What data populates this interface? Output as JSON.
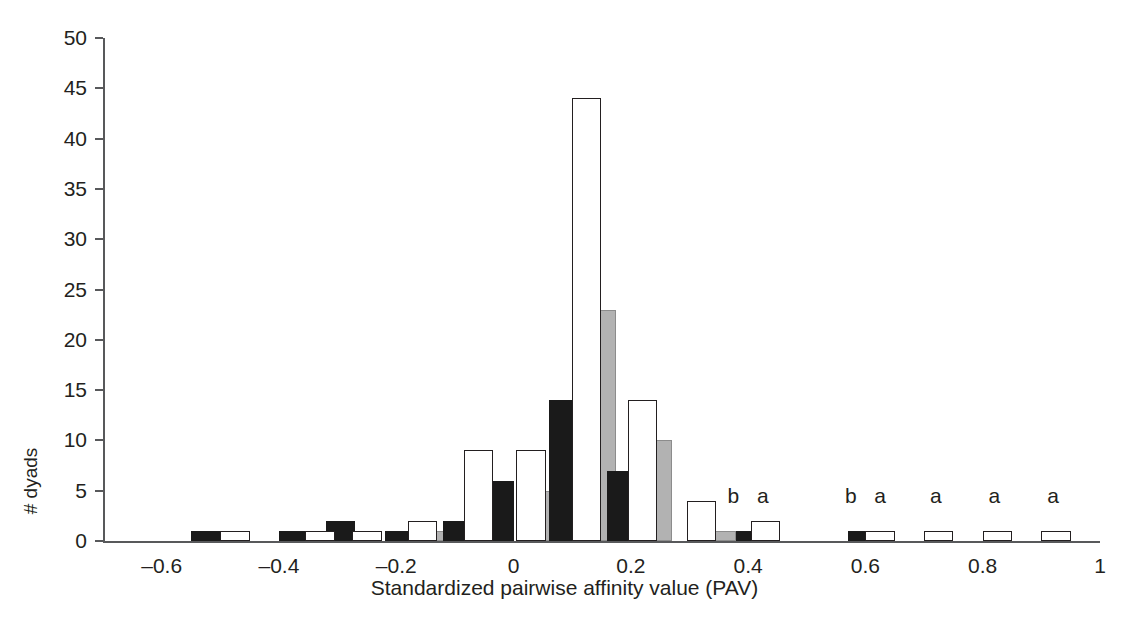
{
  "chart_data": {
    "type": "bar",
    "title": "",
    "subtitle": "",
    "xlabel": "Standardized pairwise affinity value (PAV)",
    "ylabel": "# dyads",
    "xlim": [
      -0.7,
      1.0
    ],
    "ylim": [
      0,
      50
    ],
    "grid": false,
    "legend": "none",
    "bin_width": 0.05,
    "x_ticks": [
      "–0.6",
      "–0.4",
      "–0.2",
      "0",
      "0.2",
      "0.4",
      "0.6",
      "0.8",
      "1"
    ],
    "x_tick_values": [
      -0.6,
      -0.4,
      -0.2,
      0,
      0.2,
      0.4,
      0.6,
      0.8,
      1
    ],
    "y_ticks": [
      "0",
      "5",
      "10",
      "15",
      "20",
      "25",
      "30",
      "35",
      "40",
      "45",
      "50"
    ],
    "y_tick_values": [
      0,
      5,
      10,
      15,
      20,
      25,
      30,
      35,
      40,
      45,
      50
    ],
    "series": [
      {
        "name": "black",
        "color": "#1a1a1a",
        "bars": [
          {
            "x": -0.55,
            "value": 1
          },
          {
            "x": -0.4,
            "value": 1
          },
          {
            "x": -0.32,
            "value": 2
          },
          {
            "x": -0.22,
            "value": 1
          },
          {
            "x": -0.12,
            "value": 2
          },
          {
            "x": -0.05,
            "value": 6
          },
          {
            "x": 0.06,
            "value": 14
          },
          {
            "x": 0.16,
            "value": 7
          },
          {
            "x": 0.38,
            "value": 1
          },
          {
            "x": 0.57,
            "value": 1
          }
        ]
      },
      {
        "name": "white",
        "color": "#ffffff",
        "bars": [
          {
            "x": -0.5,
            "value": 1
          },
          {
            "x": -0.355,
            "value": 1
          },
          {
            "x": -0.275,
            "value": 1
          },
          {
            "x": -0.18,
            "value": 2
          },
          {
            "x": -0.085,
            "value": 9
          },
          {
            "x": 0.005,
            "value": 9
          },
          {
            "x": 0.1,
            "value": 44
          },
          {
            "x": 0.195,
            "value": 14
          },
          {
            "x": 0.295,
            "value": 4
          },
          {
            "x": 0.405,
            "value": 2
          },
          {
            "x": 0.6,
            "value": 1
          },
          {
            "x": 0.7,
            "value": 1
          },
          {
            "x": 0.8,
            "value": 1
          },
          {
            "x": 0.9,
            "value": 1
          }
        ]
      },
      {
        "name": "gray",
        "color": "#b2b2b2",
        "bars": [
          {
            "x": -0.155,
            "value": 1
          },
          {
            "x": -0.065,
            "value": 4
          },
          {
            "x": 0.03,
            "value": 5
          },
          {
            "x": 0.125,
            "value": 23
          },
          {
            "x": 0.22,
            "value": 10
          },
          {
            "x": 0.33,
            "value": 1
          }
        ]
      }
    ],
    "annotations": [
      {
        "text": "b",
        "x": 0.375,
        "y": 4
      },
      {
        "text": "a",
        "x": 0.425,
        "y": 4
      },
      {
        "text": "b",
        "x": 0.575,
        "y": 4
      },
      {
        "text": "a",
        "x": 0.625,
        "y": 4
      },
      {
        "text": "a",
        "x": 0.72,
        "y": 4
      },
      {
        "text": "a",
        "x": 0.82,
        "y": 4
      },
      {
        "text": "a",
        "x": 0.92,
        "y": 4
      }
    ]
  }
}
